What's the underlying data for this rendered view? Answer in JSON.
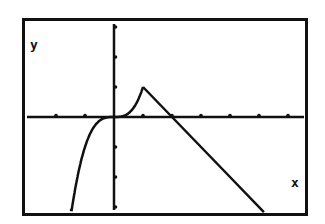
{
  "chart_data": {
    "type": "line",
    "title": "",
    "xlabel": "x",
    "ylabel": "y",
    "function_description": "Piecewise: y = x^3 for x < 1; y = -x + 2 for x >= 1",
    "series": [
      {
        "name": "cubic piece (y = x^3)",
        "x": [
          -1.52,
          -1.4,
          -1.2,
          -1.0,
          -0.8,
          -0.6,
          -0.4,
          -0.2,
          0.0,
          0.2,
          0.4,
          0.6,
          0.8,
          1.0
        ],
        "y": [
          -3.51,
          -2.74,
          -1.73,
          -1.0,
          -0.51,
          -0.22,
          -0.06,
          -0.01,
          0.0,
          0.01,
          0.06,
          0.22,
          0.51,
          1.0
        ]
      },
      {
        "name": "linear piece (y = -x + 2)",
        "x": [
          1.0,
          2.0,
          3.0,
          4.0,
          5.17
        ],
        "y": [
          1.0,
          0.0,
          -1.0,
          -2.0,
          -3.17
        ]
      }
    ],
    "xlim": [
      -3.1,
      6.7
    ],
    "ylim": [
      -3.2,
      3.3
    ],
    "x_ticks": [
      -2,
      -1,
      1,
      2,
      3,
      4,
      5,
      6
    ],
    "y_ticks": [
      -3,
      -2,
      -1,
      1,
      2,
      3
    ],
    "tick_labels_shown": false,
    "grid": false,
    "legend": null,
    "frame": true
  },
  "labels": {
    "x_axis": "x",
    "y_axis": "y"
  },
  "colors": {
    "ink": "#111111",
    "background": "#ffffff"
  }
}
